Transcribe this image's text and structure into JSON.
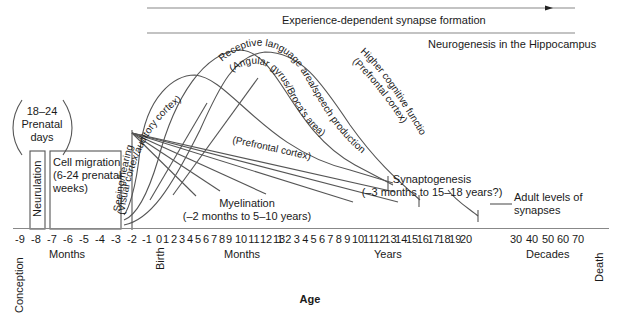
{
  "chart_data": {
    "type": "diagram",
    "xlabel": "Age",
    "axis_ticks": [
      "-9",
      "-8",
      "-7",
      "-6",
      "-5",
      "-4",
      "-3",
      "-2",
      "-1",
      "0",
      "1",
      "2",
      "3",
      "4",
      "5",
      "6",
      "7",
      "8",
      "9",
      "10",
      "11",
      "12",
      "13",
      "1",
      "2",
      "3",
      "4",
      "5",
      "6",
      "7",
      "8",
      "9",
      "10",
      "11",
      "12",
      "13",
      "14",
      "15",
      "16",
      "17",
      "18",
      "19",
      "20",
      "30",
      "40",
      "50",
      "60",
      "70"
    ],
    "axis_segments": [
      {
        "label": "Months",
        "range": [
          "-9",
          "-2"
        ],
        "unit": "prenatal months"
      },
      {
        "label": "Months",
        "range": [
          "0",
          "13"
        ],
        "unit": "postnatal months"
      },
      {
        "label": "Years",
        "range": [
          "1",
          "20"
        ],
        "unit": "years"
      },
      {
        "label": "Decades",
        "range": [
          "30",
          "70"
        ],
        "unit": "decades"
      }
    ],
    "milestones": [
      {
        "label": "Conception",
        "at": "-9 months"
      },
      {
        "label": "Birth",
        "at": "0"
      },
      {
        "label": "Death",
        "at": "70+ years"
      }
    ],
    "processes": [
      {
        "name": "18–24 Prenatal days",
        "type": "bracket-note"
      },
      {
        "name": "Neurulation",
        "type": "box",
        "range": [
          "-8",
          "-7 months"
        ]
      },
      {
        "name": "Cell migration (6-24 prenatal weeks)",
        "type": "box",
        "range": [
          "-7",
          "-3 months"
        ]
      },
      {
        "name": "Seeing/hearing (Visual cortex/auditory cortex)",
        "type": "curve",
        "peak": "~4 months"
      },
      {
        "name": "Receptive language area/speech production (Angular gyrus/Broca's area)",
        "type": "curve",
        "peak": "~8 months"
      },
      {
        "name": "Higher cognitive function (Prefrontal cortex)",
        "type": "curve",
        "peak": "~1–2 years"
      },
      {
        "name": "Synaptogenesis (−3 months to 15–18 years?)",
        "type": "curve-group"
      },
      {
        "name": "Myelination (−2 months to 5–10 years)",
        "type": "line-fan"
      },
      {
        "name": "(Prefrontal cortex)",
        "type": "myelination-line",
        "end": "~10 years"
      },
      {
        "name": "Adult levels of synapses",
        "type": "plateau",
        "start": "~18 years"
      },
      {
        "name": "Experience-dependent synapse formation",
        "type": "arrow",
        "range": [
          "-2 months",
          "death"
        ]
      },
      {
        "name": "Neurogenesis in the Hippocampus",
        "type": "line",
        "range": [
          "-2 months",
          "death"
        ]
      }
    ]
  },
  "labels": {
    "experience": "Experience-dependent synapse formation",
    "neurogenesis": "Neurogenesis in the Hippocampus",
    "prenatal_days_1": "18–24",
    "prenatal_days_2": "Prenatal",
    "prenatal_days_3": "days",
    "neurulation": "Neurulation",
    "cell_migration_1": "Cell migration",
    "cell_migration_2": "(6-24 prenatal",
    "cell_migration_3": "weeks)",
    "seeing": "Seeing/hearing",
    "visual": "(Visual cortex/auditory cortex)",
    "receptive": "Receptive language area/speech production",
    "angular": "(Angular gyrus/Broca's area)",
    "higher": "Higher cognitive function",
    "prefrontal_upper": "(Prefrontal cortex)",
    "prefrontal_mid": "(Prefrontal cortex)",
    "myelination_1": "Myelination",
    "myelination_2": "(–2 months to 5–10 years)",
    "synaptogenesis_1": "Synaptogenesis",
    "synaptogenesis_2": "(–3 months to 15–18 years?)",
    "adult_1": "Adult levels of",
    "adult_2": "synapses",
    "months_prenatal": "Months",
    "months_postnatal": "Months",
    "years": "Years",
    "decades": "Decades",
    "conception": "Conception",
    "birth": "Birth",
    "death": "Death",
    "age": "Age"
  }
}
